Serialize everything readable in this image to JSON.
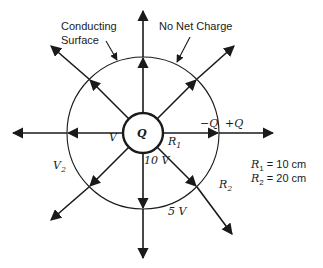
{
  "diagram": {
    "labels": {
      "conducting_surface_1": "Conducting",
      "conducting_surface_2": "Surface",
      "no_net_charge": "No Net Charge",
      "inner_charge": "Q",
      "inner_potential": "V",
      "r1": "R",
      "r1_sub": "1",
      "r2": "R",
      "r2_sub": "2",
      "v2": "V",
      "v2_sub": "2",
      "inner_voltage": "10 V",
      "outer_voltage": "5 V",
      "neg_charge": "−Q",
      "pos_charge": "+Q"
    },
    "legend": {
      "r1_label": "R",
      "r1_sub": "1",
      "r1_value": " = 10 cm",
      "r2_label": "R",
      "r2_sub": "2",
      "r2_value": " = 20 cm"
    },
    "colors": {
      "stroke": "#1a1a1a",
      "background": "#ffffff"
    }
  }
}
